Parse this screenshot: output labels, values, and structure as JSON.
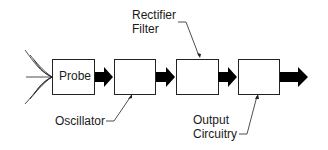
{
  "diagram": {
    "blocks": [
      {
        "id": "probe",
        "label": "Probe"
      },
      {
        "id": "oscillator",
        "label": ""
      },
      {
        "id": "rectifier-filter",
        "label": ""
      },
      {
        "id": "output-circuitry",
        "label": ""
      }
    ],
    "callouts": {
      "oscillator": "Oscillator",
      "rectifier_line1": "Rectifier",
      "rectifier_line2": "Filter",
      "output_line1": "Output",
      "output_line2": "Circuitry"
    }
  }
}
